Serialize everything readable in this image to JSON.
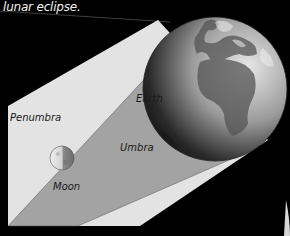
{
  "caption": "lunar eclipse.",
  "labels": {
    "penumbra": "Penumbra",
    "umbra": "Umbra",
    "earth": "Earth",
    "moon": "Moon"
  },
  "colors": {
    "background": "#000000",
    "penumbra": "#e3e3e3",
    "umbra": "#a3a3a3",
    "caption_text": "#f2f2f2",
    "label_text": "#1a1a1a"
  }
}
